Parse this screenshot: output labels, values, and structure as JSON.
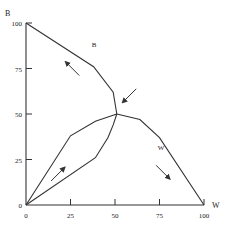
{
  "chart_data": {
    "type": "line",
    "title": "",
    "xlabel": "W",
    "ylabel": "B",
    "xlim": [
      0,
      100
    ],
    "ylim": [
      0,
      100
    ],
    "grid": false,
    "xticks": [
      0,
      25,
      50,
      75,
      100
    ],
    "yticks": [
      0,
      25,
      50,
      75,
      100
    ],
    "xtick_labels": [
      "0",
      "25",
      "50",
      "75",
      "100"
    ],
    "ytick_labels": [
      "0",
      "25",
      "50",
      "75",
      "100"
    ],
    "series": [
      {
        "name": "B",
        "points": [
          [
            0,
            100
          ],
          [
            38,
            76
          ],
          [
            49,
            62
          ],
          [
            51,
            50
          ]
        ]
      },
      {
        "name": "W",
        "points": [
          [
            51,
            50
          ],
          [
            64,
            47
          ],
          [
            75,
            37
          ],
          [
            100,
            0
          ]
        ]
      },
      {
        "name": "upper-path",
        "points": [
          [
            0,
            0
          ],
          [
            25,
            38
          ],
          [
            39,
            46
          ],
          [
            51,
            50
          ]
        ]
      },
      {
        "name": "lower-path",
        "points": [
          [
            0,
            0
          ],
          [
            39,
            26
          ],
          [
            46,
            37
          ],
          [
            49,
            44
          ],
          [
            51,
            50
          ]
        ]
      }
    ],
    "annotations": [
      {
        "type": "label",
        "text": "B",
        "at": [
          37,
          87
        ]
      },
      {
        "type": "label",
        "text": "W",
        "at": [
          74,
          30
        ]
      },
      {
        "type": "arrow",
        "direction": "up-left",
        "at": [
          26,
          75
        ]
      },
      {
        "type": "arrow",
        "direction": "down-left",
        "at": [
          58,
          60
        ]
      },
      {
        "type": "arrow",
        "direction": "down-right",
        "at": [
          77,
          18
        ]
      },
      {
        "type": "arrow",
        "direction": "up-right",
        "at": [
          18,
          17
        ]
      }
    ],
    "colors": {
      "line": "#333333",
      "background": "#ffffff"
    }
  }
}
